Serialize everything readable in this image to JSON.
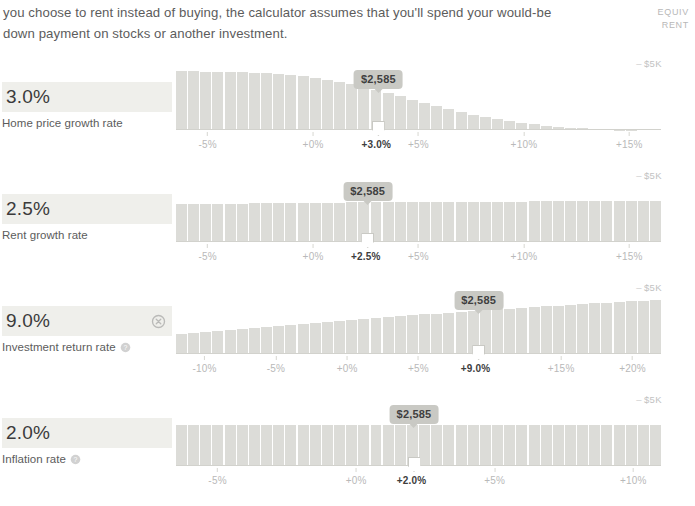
{
  "intro": {
    "paragraph": "you choose to rent instead of buying, the calculator assumes that you'll spend your would-be down payment on stocks or another investment."
  },
  "axis_header": {
    "line1": "EQUIV",
    "line2": "RENT"
  },
  "y_axis_label": "$5K",
  "y_axis_dash": "–",
  "sliders": [
    {
      "value": "3.0%",
      "label": "Home price growth rate",
      "has_reset": false,
      "has_help": false,
      "tooltip": "$2,585",
      "current_tick": "+3.0%",
      "handle_pos": 0.405
    },
    {
      "value": "2.5%",
      "label": "Rent growth rate",
      "has_reset": false,
      "has_help": false,
      "tooltip": "$2,585",
      "current_tick": "+2.5%",
      "handle_pos": 0.378
    },
    {
      "value": "9.0%",
      "label": "Investment return rate",
      "has_reset": true,
      "has_help": true,
      "tooltip": "$2,585",
      "current_tick": "+9.0%",
      "handle_pos": 0.625
    },
    {
      "value": "2.0%",
      "label": "Inflation rate",
      "has_reset": false,
      "has_help": true,
      "tooltip": "$2,585",
      "current_tick": "+2.0%",
      "handle_pos": 0.452
    }
  ],
  "icons": {
    "reset": "reset-circle-icon",
    "help": "help-circle-icon"
  },
  "colors": {
    "bar": "#dcdcd8",
    "chip_bg": "#efefeb",
    "tooltip_bg": "#c9c9c4",
    "tick_text": "#b9b9b9",
    "current_tick_text": "#3d3d3d"
  },
  "chart_data": [
    {
      "type": "bar",
      "title": "Home price growth rate",
      "xlabel": "",
      "ylabel": "EQUIV RENT",
      "ylim": [
        0,
        5000
      ],
      "y_ticks": [
        5000
      ],
      "y_tick_labels": [
        "$5K"
      ],
      "x_ticks": [
        -5,
        0,
        3,
        5,
        10,
        15
      ],
      "x_tick_labels": [
        "-5%",
        "+0%",
        "+3.0%",
        "+5%",
        "+10%",
        "+15%"
      ],
      "xlim": [
        -6.5,
        16.5
      ],
      "current_x": 3,
      "current_value": "$2,585",
      "grid": false,
      "legend": "none",
      "values": [
        4750,
        4720,
        4700,
        4690,
        4680,
        4660,
        4620,
        4570,
        4500,
        4420,
        4320,
        4200,
        4060,
        3900,
        3710,
        3500,
        3260,
        3000,
        2730,
        2450,
        2180,
        1920,
        1680,
        1460,
        1250,
        1060,
        890,
        730,
        590,
        470,
        360,
        270,
        190,
        130,
        85,
        50,
        28,
        14,
        6,
        2
      ]
    },
    {
      "type": "bar",
      "title": "Rent growth rate",
      "xlabel": "",
      "ylabel": "EQUIV RENT",
      "ylim": [
        0,
        5000
      ],
      "y_ticks": [
        5000
      ],
      "y_tick_labels": [
        "$5K"
      ],
      "x_ticks": [
        -5,
        0,
        2.5,
        5,
        10,
        15
      ],
      "x_tick_labels": [
        "-5%",
        "+0%",
        "+2.5%",
        "+5%",
        "+10%",
        "+15%"
      ],
      "xlim": [
        -6.5,
        16.5
      ],
      "current_x": 2.5,
      "current_value": "$2,585",
      "grid": false,
      "legend": "none",
      "values": [
        3050,
        3060,
        3070,
        3080,
        3090,
        3100,
        3110,
        3120,
        3130,
        3140,
        3150,
        3160,
        3170,
        3180,
        3190,
        3200,
        3205,
        3210,
        3215,
        3220,
        3225,
        3230,
        3235,
        3240,
        3245,
        3250,
        3255,
        3260,
        3265,
        3270,
        3275,
        3280,
        3285,
        3290,
        3295,
        3300,
        3305,
        3310,
        3315,
        3320
      ]
    },
    {
      "type": "bar",
      "title": "Investment return rate",
      "xlabel": "",
      "ylabel": "EQUIV RENT",
      "ylim": [
        0,
        5000
      ],
      "y_ticks": [
        5000
      ],
      "y_tick_labels": [
        "$5K"
      ],
      "x_ticks": [
        -10,
        -5,
        0,
        5,
        9,
        15,
        20
      ],
      "x_tick_labels": [
        "-10%",
        "-5%",
        "+0%",
        "+5%",
        "+9.0%",
        "+15%",
        "+20%"
      ],
      "xlim": [
        -12,
        22
      ],
      "current_x": 9,
      "current_value": "$2,585",
      "grid": false,
      "legend": "none",
      "values": [
        1650,
        1720,
        1800,
        1880,
        1960,
        2040,
        2120,
        2200,
        2280,
        2360,
        2440,
        2520,
        2600,
        2680,
        2760,
        2840,
        2910,
        2980,
        3050,
        3120,
        3190,
        3260,
        3330,
        3400,
        3470,
        3540,
        3610,
        3670,
        3730,
        3790,
        3850,
        3910,
        3970,
        4030,
        4090,
        4150,
        4210,
        4260,
        4310,
        4360
      ]
    },
    {
      "type": "bar",
      "title": "Inflation rate",
      "xlabel": "",
      "ylabel": "EQUIV RENT",
      "ylim": [
        0,
        5000
      ],
      "y_ticks": [
        5000
      ],
      "y_tick_labels": [
        "$5K"
      ],
      "x_ticks": [
        -5,
        0,
        2,
        5,
        10
      ],
      "x_tick_labels": [
        "-5%",
        "+0%",
        "+2.0%",
        "+5%",
        "+10%"
      ],
      "xlim": [
        -6.5,
        11
      ],
      "current_x": 2,
      "current_value": "$2,585",
      "grid": false,
      "legend": "none",
      "values": [
        3300,
        3300,
        3300,
        3300,
        3300,
        3300,
        3300,
        3300,
        3300,
        3300,
        3300,
        3300,
        3300,
        3300,
        3300,
        3300,
        3300,
        3300,
        3300,
        3300,
        3300,
        3300,
        3300,
        3300,
        3300,
        3300,
        3300,
        3300,
        3300,
        3300,
        3300,
        3300,
        3300,
        3300,
        3300,
        3300,
        3300,
        3300,
        3300,
        3300
      ]
    }
  ]
}
